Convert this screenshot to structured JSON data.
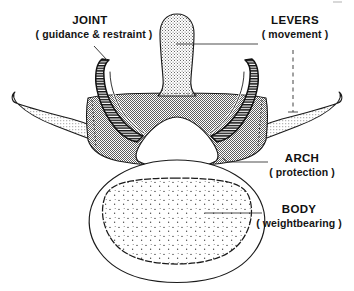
{
  "figure": {
    "name": "vertebra-superior-view-diagram",
    "background_color": "#ffffff",
    "ink_color": "#101010"
  },
  "labels": [
    {
      "id": "joint",
      "title": "JOINT",
      "subtitle": "( guidance & restraint )",
      "points_to": "superior-articular-process",
      "leader_style": "solid-diagonal"
    },
    {
      "id": "levers",
      "title": "LEVERS",
      "subtitle": "( movement )",
      "points_to": "spinous-and-transverse-processes",
      "leader_style": "solid-horizontal-plus-dashed-vertical"
    },
    {
      "id": "arch",
      "title": "ARCH",
      "subtitle": "( protection )",
      "points_to": "vertebral-arch",
      "leader_style": "solid-horizontal"
    },
    {
      "id": "body",
      "title": "BODY",
      "subtitle": "( weightbearing )",
      "points_to": "vertebral-body",
      "leader_style": "solid-horizontal"
    }
  ],
  "anatomy": {
    "spinous_process": {
      "name": "spinous-process",
      "fill": "stipple-medium",
      "fill_color": "#d7d7d7"
    },
    "transverse_process_left": {
      "name": "transverse-process-left",
      "fill": "stipple-light",
      "fill_color": "#e2e2e2"
    },
    "transverse_process_right": {
      "name": "transverse-process-right",
      "fill": "stipple-light",
      "fill_color": "#e2e2e2"
    },
    "vertebral_arch": {
      "name": "vertebral-arch",
      "fill": "halftone-gray",
      "fill_color": "#c2c2c2"
    },
    "articular_process_left": {
      "name": "superior-articular-process-left",
      "fill": "dense-horizontal-hatch",
      "fill_color": "#1a1a1a"
    },
    "articular_process_right": {
      "name": "superior-articular-process-right",
      "fill": "dense-horizontal-hatch",
      "fill_color": "#1a1a1a"
    },
    "vertebral_foramen": {
      "name": "vertebral-foramen",
      "fill": "none",
      "fill_color": "#ffffff"
    },
    "vertebral_body": {
      "name": "vertebral-body",
      "fill": "none",
      "fill_color": "#ffffff"
    },
    "cancellous_bone": {
      "name": "cancellous-bone-region",
      "fill": "sparse-stipple-dots",
      "fill_color": "#fafafa"
    }
  }
}
